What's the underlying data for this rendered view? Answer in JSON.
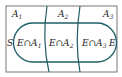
{
  "diagram": {
    "type": "venn-partition",
    "sample_space_label": "S",
    "event_label": "E",
    "partitions": [
      {
        "label": "A",
        "sub": "1",
        "intersection": "E∩A",
        "intersection_sub": "1"
      },
      {
        "label": "A",
        "sub": "2",
        "intersection": "E∩A",
        "intersection_sub": "2"
      },
      {
        "label": "A",
        "sub": "3",
        "intersection": "E∩A",
        "intersection_sub": "3"
      }
    ],
    "colors": {
      "border": "#444444",
      "curve": "#1f5e66",
      "text": "#222222"
    }
  }
}
